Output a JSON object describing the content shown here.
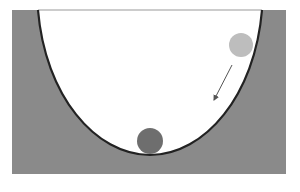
{
  "diagram": {
    "colors": {
      "background": "#ffffff",
      "ground_fill": "#8a8a8a",
      "bowl_interior": "#ffffff",
      "bowl_outline": "#222222",
      "top_line": "#999999",
      "ball_at_rest": "#6e6e6e",
      "ball_ghost": "#bdbdbd",
      "arrow": "#555555"
    },
    "elements": {
      "ball_at_rest": {
        "label": "ball at bottom of bowl"
      },
      "ball_ghost": {
        "label": "ball starting position on bowl wall"
      },
      "motion_arrow": {
        "label": "direction of motion",
        "direction": "down-left"
      }
    }
  }
}
